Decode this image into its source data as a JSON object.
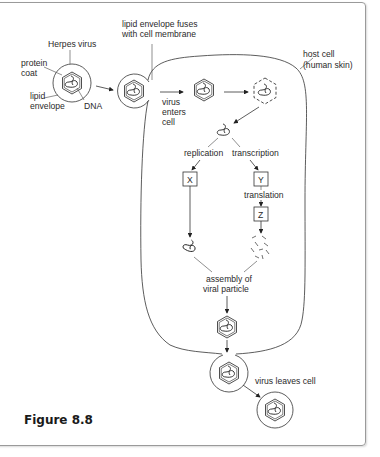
{
  "figure": {
    "caption": "Figure 8.8"
  },
  "labels": {
    "herpes_virus": "Herpes virus",
    "protein_coat_1": "protein",
    "protein_coat_2": "coat",
    "lipid_envelope_1": "lipid",
    "lipid_envelope_2": "envelope",
    "dna": "DNA",
    "fuses_1": "lipid envelope fuses",
    "fuses_2": "with cell membrane",
    "enters_1": "virus",
    "enters_2": "enters",
    "enters_3": "cell",
    "host_1": "host cell",
    "host_2": "(human skin)",
    "replication": "replication",
    "transcription": "transcription",
    "translation": "translation",
    "box_x": "X",
    "box_y": "Y",
    "box_z": "Z",
    "assembly_1": "assembly of",
    "assembly_2": "viral particle",
    "leaves": "virus leaves cell"
  },
  "colors": {
    "line": "#333333",
    "frame": "#9a9a9a",
    "text": "#2a2a2a"
  }
}
